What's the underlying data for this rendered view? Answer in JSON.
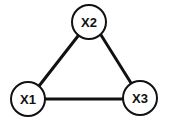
{
  "diagram": {
    "type": "undirected-graph",
    "nodes": [
      {
        "id": "X1",
        "label": "X1",
        "cx": 28,
        "cy": 99,
        "r": 17
      },
      {
        "id": "X2",
        "label": "X2",
        "cx": 89,
        "cy": 22,
        "r": 17
      },
      {
        "id": "X3",
        "label": "X3",
        "cx": 140,
        "cy": 98,
        "r": 17
      }
    ],
    "edges": [
      {
        "from": "X1",
        "to": "X2"
      },
      {
        "from": "X2",
        "to": "X3"
      },
      {
        "from": "X1",
        "to": "X3"
      }
    ],
    "colors": {
      "stroke": "#111111",
      "fill": "#ffffff",
      "background": "#ffffff"
    }
  }
}
